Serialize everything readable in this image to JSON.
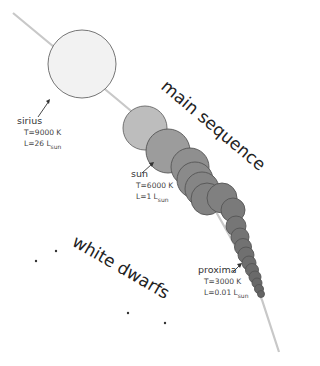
{
  "diagram": {
    "type": "main-sequence-star-diagram",
    "colors": {
      "background": "#ffffff",
      "track_line": "#c8c8c8",
      "outline": "#555555",
      "label_text": "#333333"
    },
    "region_labels": {
      "main_sequence": "main sequence",
      "white_dwarfs": "white dwarfs"
    },
    "stars": [
      {
        "name": "sirius",
        "temperature": "T=9000 K",
        "luminosity_prefix": "L=26 L",
        "luminosity_sub": "sun"
      },
      {
        "name": "sun",
        "temperature": "T=6000 K",
        "luminosity_prefix": "L=1 L",
        "luminosity_sub": "sun"
      },
      {
        "name": "proxima",
        "temperature": "T=3000 K",
        "luminosity_prefix": "L=0.01 L",
        "luminosity_sub": "sun"
      }
    ]
  }
}
